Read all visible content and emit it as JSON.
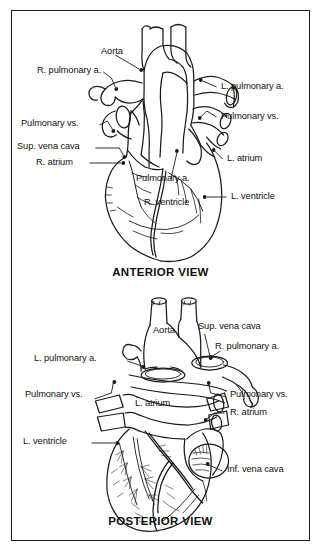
{
  "figure": {
    "line_color": "#1a1a1a",
    "background_color": "#ffffff",
    "text_color": "#111111"
  },
  "anterior": {
    "view_title": "ANTERIOR VIEW",
    "labels": [
      {
        "id": "aorta",
        "text": "Aorta"
      },
      {
        "id": "r-pulmonary-a",
        "text": "R. pulmonary a."
      },
      {
        "id": "pulmonary-vs-l",
        "text": "Pulmonary vs."
      },
      {
        "id": "sup-vena-cava",
        "text": "Sup. vena cava"
      },
      {
        "id": "r-atrium",
        "text": "R. atrium"
      },
      {
        "id": "pulmonary-a",
        "text": "Pulmonary a."
      },
      {
        "id": "r-ventricle",
        "text": "R. ventricle"
      },
      {
        "id": "l-pulmonary-a",
        "text": "L. pulmonary a."
      },
      {
        "id": "pulmonary-vs-r",
        "text": "Pulmonary vs."
      },
      {
        "id": "l-atrium",
        "text": "L. atrium"
      },
      {
        "id": "l-ventricle",
        "text": "L. ventricle"
      }
    ]
  },
  "posterior": {
    "view_title": "POSTERIOR VIEW",
    "labels": [
      {
        "id": "aorta",
        "text": "Aorta"
      },
      {
        "id": "sup-vena-cava",
        "text": "Sup. vena cava"
      },
      {
        "id": "r-pulmonary-a",
        "text": "R. pulmonary a."
      },
      {
        "id": "l-pulmonary-a",
        "text": "L. pulmonary a."
      },
      {
        "id": "pulmonary-vs-l",
        "text": "Pulmonary vs."
      },
      {
        "id": "l-atrium",
        "text": "L. atrium"
      },
      {
        "id": "pulmonary-vs-r",
        "text": "Pulmonary vs."
      },
      {
        "id": "r-atrium",
        "text": "R. atrium"
      },
      {
        "id": "l-ventricle",
        "text": "L. ventricle"
      },
      {
        "id": "inf-vena-cava",
        "text": "Inf. vena cava"
      }
    ]
  }
}
